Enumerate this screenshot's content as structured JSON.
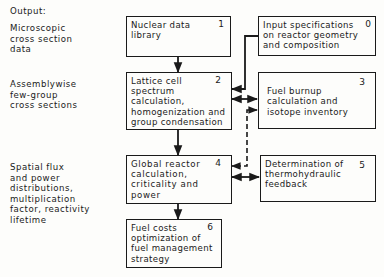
{
  "diagram": {
    "output_heading": "Output:",
    "outputs": [
      {
        "id": "microscopic",
        "text": "Microscopic\ncross section\ndata"
      },
      {
        "id": "assemblywise",
        "text": "Assemblywise\nfew-group\ncross sections"
      },
      {
        "id": "spatial",
        "text": "Spatial flux\nand power\ndistributions,\nmultiplication\nfactor, reactivity\nlifetime"
      }
    ],
    "boxes": [
      {
        "number": "0",
        "text": "Input specifications\non reactor geometry\nand composition"
      },
      {
        "number": "1",
        "text": "Nuclear data\nlibrary"
      },
      {
        "number": "2",
        "text": "Lattice cell\nspectrum\ncalculation,\nhomogenization and\ngroup condensation"
      },
      {
        "number": "3",
        "text": "\nFuel burnup\ncalculation and\nisotope inventory"
      },
      {
        "number": "4",
        "text": "Global reactor\ncalculation,\ncriticality and\npower"
      },
      {
        "number": "5",
        "text": "Determination of\nthermohydraulic\nfeedback"
      },
      {
        "number": "6",
        "text": "Fuel costs\noptimization of\nfuel management\nstrategy"
      }
    ],
    "connections": [
      {
        "from": "1",
        "to": "2",
        "style": "solid",
        "direction": "forward"
      },
      {
        "from": "0",
        "to": "2",
        "style": "solid",
        "direction": "forward"
      },
      {
        "from": "2",
        "to": "3",
        "style": "solid",
        "direction": "both"
      },
      {
        "from": "4",
        "to": "3",
        "style": "dashed",
        "direction": "both"
      },
      {
        "from": "2",
        "to": "4",
        "style": "solid",
        "direction": "forward"
      },
      {
        "from": "4",
        "to": "5",
        "style": "solid",
        "direction": "both"
      },
      {
        "from": "4",
        "to": "6",
        "style": "solid",
        "direction": "forward"
      }
    ],
    "colors": {
      "ink": "#1a1a1a",
      "paper": "#fdfdfb"
    }
  }
}
